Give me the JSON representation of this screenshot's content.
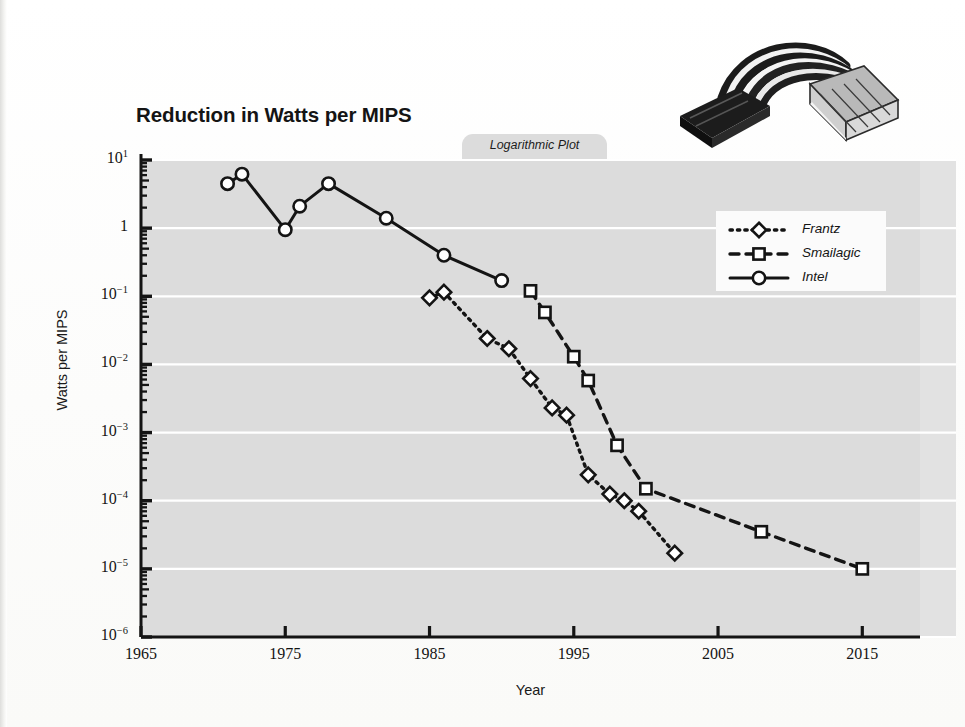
{
  "figure": {
    "title": "Reduction in Watts per MIPS",
    "tab_label": "Logarithmic Plot",
    "photo_alt": "sata-power-adapter-cable"
  },
  "legend": {
    "position": "upper-right",
    "entries": [
      {
        "label": "Frantz",
        "marker": "diamond",
        "line": "dotted"
      },
      {
        "label": "Smailagic",
        "marker": "square",
        "line": "dashed"
      },
      {
        "label": "Intel",
        "marker": "circle",
        "line": "solid"
      }
    ]
  },
  "axes": {
    "x": {
      "label": "Year",
      "ticks": [
        "1965",
        "1975",
        "1985",
        "1995",
        "2005",
        "2015"
      ],
      "tick_values": [
        1965,
        1975,
        1985,
        1995,
        2005,
        2015
      ],
      "range": [
        1965,
        2019
      ]
    },
    "y": {
      "label": "Watts per MIPS",
      "scale": "log",
      "ticks": [
        "10^1",
        "1",
        "10^-1",
        "10^-2",
        "10^-3",
        "10^-4",
        "10^-5",
        "10^-6"
      ],
      "tick_exponents": [
        1,
        0,
        -1,
        -2,
        -3,
        -4,
        -5,
        -6
      ],
      "range": [
        1e-06,
        10
      ]
    },
    "grid": "horizontal-white-major"
  },
  "colors": {
    "plot_background": "#dcdcdc",
    "gridline": "#ffffff",
    "ink": "#141414",
    "legend_background": "#fbfbfb",
    "page_background": "#fdfdfd"
  },
  "chart_data": {
    "type": "line",
    "title": "Reduction in Watts per MIPS",
    "subtitle": "Logarithmic Plot",
    "xlabel": "Year",
    "ylabel": "Watts per MIPS",
    "yscale": "log",
    "xlim": [
      1965,
      2019
    ],
    "ylim": [
      1e-06,
      10
    ],
    "grid": true,
    "legend_position": "upper-right",
    "series": [
      {
        "name": "Intel",
        "marker": "circle",
        "line": "solid",
        "points": [
          [
            1971,
            4.5
          ],
          [
            1972,
            6.2
          ],
          [
            1975,
            0.95
          ],
          [
            1976,
            2.1
          ],
          [
            1978,
            4.5
          ],
          [
            1982,
            1.4
          ],
          [
            1986,
            0.4
          ],
          [
            1990,
            0.17
          ]
        ]
      },
      {
        "name": "Frantz",
        "marker": "diamond",
        "line": "dotted",
        "points": [
          [
            1985,
            0.095
          ],
          [
            1986,
            0.115
          ],
          [
            1989,
            0.024
          ],
          [
            1990.5,
            0.017
          ],
          [
            1992,
            0.0062
          ],
          [
            1993.5,
            0.0023
          ],
          [
            1994.5,
            0.0018
          ],
          [
            1996,
            0.00024
          ],
          [
            1997.5,
            0.000125
          ],
          [
            1998.5,
            0.0001
          ],
          [
            1999.5,
            7e-05
          ],
          [
            2002,
            1.7e-05
          ]
        ]
      },
      {
        "name": "Smailagic",
        "marker": "square",
        "line": "dashed",
        "points": [
          [
            1992,
            0.12
          ],
          [
            1993,
            0.058
          ],
          [
            1995,
            0.013
          ],
          [
            1996,
            0.0058
          ],
          [
            1998,
            0.00065
          ],
          [
            2000,
            0.00015
          ],
          [
            2008,
            3.5e-05
          ],
          [
            2015,
            1e-05
          ]
        ]
      }
    ]
  }
}
